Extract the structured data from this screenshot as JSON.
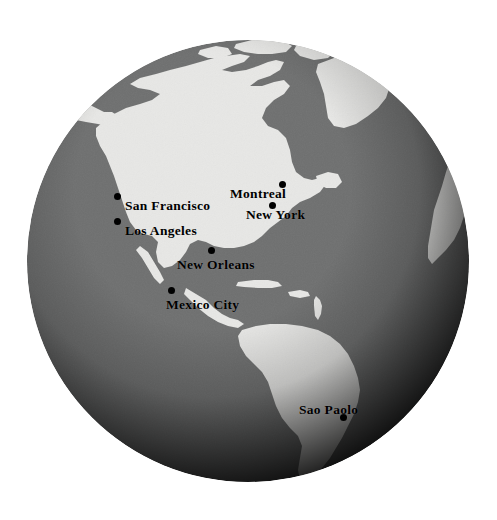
{
  "scene": {
    "kind": "globe-map",
    "title": "Globe view of the Americas",
    "projection": "orthographic",
    "center_longitude": -75,
    "center_latitude": 20,
    "background_color": "#ffffff",
    "land_color": "#e8e8e6",
    "ocean_color": "#6f7070",
    "terminator_color": "#000000",
    "label_color": "#000000",
    "dot_color": "#000000"
  },
  "globe": {
    "center_x": 248,
    "center_y": 261,
    "radius": 221
  },
  "cities": [
    {
      "name": "San Francisco",
      "dot_x": 118,
      "dot_y": 197,
      "label_x": 125,
      "label_y": 198,
      "label_anchor": "left"
    },
    {
      "name": "Los Angeles",
      "dot_x": 118,
      "dot_y": 222,
      "label_x": 125,
      "label_y": 223,
      "label_anchor": "left"
    },
    {
      "name": "Montreal",
      "dot_x": 283,
      "dot_y": 185,
      "label_x": 276,
      "label_y": 186,
      "label_anchor": "right"
    },
    {
      "name": "New York",
      "dot_x": 273,
      "dot_y": 206,
      "label_x": 280,
      "label_y": 207,
      "label_anchor": "left"
    },
    {
      "name": "New Orleans",
      "dot_x": 212,
      "dot_y": 251,
      "label_x": 177,
      "label_y": 257,
      "label_anchor": "left"
    },
    {
      "name": "Mexico City",
      "dot_x": 172,
      "dot_y": 291,
      "label_x": 166,
      "label_y": 297,
      "label_anchor": "left"
    },
    {
      "name": "Sao Paolo",
      "dot_x": 344,
      "dot_y": 418,
      "label_x": 299,
      "label_y": 402,
      "label_anchor": "left"
    }
  ],
  "landmasses": [
    "North America",
    "Greenland",
    "Canadian Arctic Archipelago",
    "Central America",
    "Caribbean Islands",
    "South America",
    "West Africa"
  ]
}
